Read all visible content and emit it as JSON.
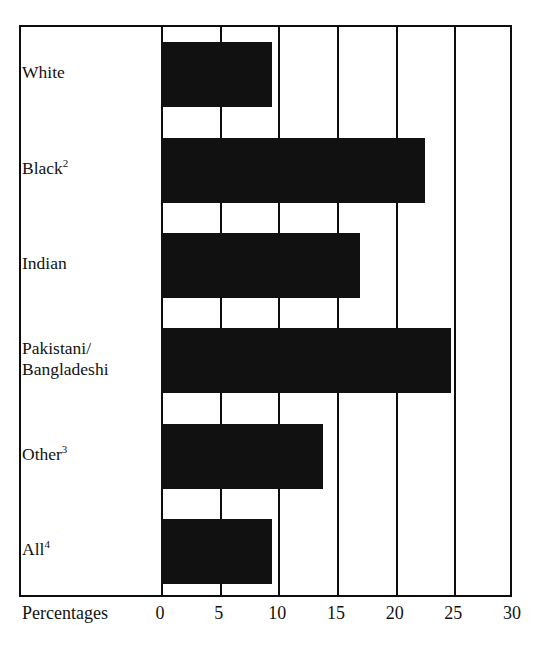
{
  "chart_data": {
    "type": "bar",
    "orientation": "horizontal",
    "title": "",
    "subtitle": "",
    "xlabel": "Percentages",
    "ylabel": "",
    "categories": [
      "White",
      "Black2",
      "Indian",
      "Pakistani/\nBangladeshi",
      "Other3",
      "All4"
    ],
    "category_labels_html": [
      "White",
      "Black<sup>2</sup>",
      "Indian",
      "Pakistani/<br>Bangladeshi",
      "Other<sup>3</sup>",
      "All<sup>4</sup>"
    ],
    "values": [
      9.5,
      22.5,
      17.0,
      24.7,
      13.8,
      9.5
    ],
    "xlim": [
      0,
      30
    ],
    "xticks": [
      0,
      5,
      10,
      15,
      20,
      25,
      30
    ],
    "xtick_labels": [
      "0",
      "5",
      "10",
      "15",
      "20",
      "25",
      "30"
    ],
    "grid": "vertical",
    "legend": "none",
    "bar_color": "#111111",
    "frame_color": "#0d0d0d",
    "background": "#ffffff"
  },
  "axis": {
    "title": "Percentages",
    "ticks": [
      {
        "value": 0,
        "label": "0"
      },
      {
        "value": 5,
        "label": "5"
      },
      {
        "value": 10,
        "label": "10"
      },
      {
        "value": 15,
        "label": "15"
      },
      {
        "value": 20,
        "label": "20"
      },
      {
        "value": 25,
        "label": "25"
      },
      {
        "value": 30,
        "label": "30"
      }
    ]
  },
  "categories": [
    {
      "label": "White",
      "sup": "",
      "value": 9.5
    },
    {
      "label": "Black",
      "sup": "2",
      "value": 22.5
    },
    {
      "label": "Indian",
      "sup": "",
      "value": 17.0
    },
    {
      "label": "Pakistani/",
      "label2": "Bangladeshi",
      "sup": "",
      "value": 24.7
    },
    {
      "label": "Other",
      "sup": "3",
      "value": 13.8
    },
    {
      "label": "All",
      "sup": "4",
      "value": 9.5
    }
  ]
}
